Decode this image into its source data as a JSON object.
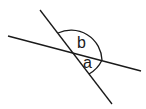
{
  "diagram": {
    "type": "intersecting-lines-angles",
    "stroke_color": "#1a1a1a",
    "background": "#ffffff",
    "lines": [
      {
        "name": "steep-line",
        "x1": 40,
        "y1": 10,
        "x2": 112,
        "y2": 104
      },
      {
        "name": "shallow-line",
        "x1": 8,
        "y1": 36,
        "x2": 141,
        "y2": 71
      }
    ],
    "intersection": {
      "x": 72,
      "y": 52
    },
    "angles": [
      {
        "label": "b",
        "label_x": 77,
        "label_y": 48
      },
      {
        "label": "a",
        "label_x": 83,
        "label_y": 68
      }
    ]
  }
}
